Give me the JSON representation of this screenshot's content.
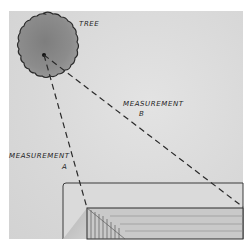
{
  "illustration": {
    "labels": {
      "tree": "TREE",
      "measurement_a": "MEASUREMENT",
      "measurement_a_letter": "A",
      "measurement_b": "MEASUREMENT",
      "measurement_b_letter": "B"
    },
    "colors": {
      "paper": "#d9d9d9",
      "tree_fill": "#8e8e8e",
      "tree_outline": "#2a2a2a",
      "line": "#2a2a2a",
      "building_top": "#dcdcdc",
      "building_face": "#c6c6c6"
    }
  }
}
